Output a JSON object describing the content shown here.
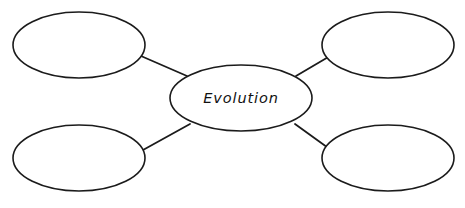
{
  "page": {
    "background_color": "#ffffff",
    "stroke_color": "#1b1b1b",
    "text_color": "#111111",
    "width": 465,
    "height": 208
  },
  "caption": {
    "cropped_top_text": ""
  },
  "diagram": {
    "type": "bubble-concept-map",
    "center": {
      "label": "Evolution",
      "cx": 241,
      "cy": 98,
      "rx": 71,
      "ry": 33
    },
    "outer_nodes": [
      {
        "id": "top-left",
        "label": "",
        "cx": 79,
        "cy": 45,
        "rx": 66,
        "ry": 33
      },
      {
        "id": "top-right",
        "label": "",
        "cx": 388,
        "cy": 45,
        "rx": 66,
        "ry": 33
      },
      {
        "id": "bottom-left",
        "label": "",
        "cx": 79,
        "cy": 158,
        "rx": 66,
        "ry": 33
      },
      {
        "id": "bottom-right",
        "label": "",
        "cx": 388,
        "cy": 158,
        "rx": 66,
        "ry": 33
      }
    ],
    "connectors": [
      {
        "id": "center-to-top-left",
        "x1": 141,
        "y1": 56,
        "x2": 187,
        "y2": 76
      },
      {
        "id": "center-to-top-right",
        "x1": 296,
        "y1": 76,
        "x2": 330,
        "y2": 56
      },
      {
        "id": "center-to-bottom-left",
        "x1": 143,
        "y1": 150,
        "x2": 190,
        "y2": 124
      },
      {
        "id": "center-to-bottom-right",
        "x1": 295,
        "y1": 124,
        "x2": 331,
        "y2": 150
      }
    ]
  }
}
